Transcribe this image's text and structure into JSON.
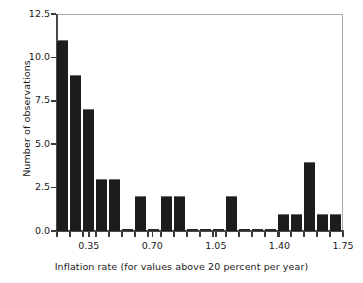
{
  "chart_data": {
    "type": "bar",
    "title": "",
    "xlabel": "Inflation rate (for values above 20 percent per year)",
    "ylabel": "Number of observations",
    "xlim": [
      0.175,
      1.75
    ],
    "ylim": [
      0.0,
      12.5
    ],
    "grid": false,
    "legend": null,
    "bin_width": 0.0715909,
    "bin_left_edges": [
      0.175,
      0.2466,
      0.3182,
      0.3898,
      0.4614,
      0.533,
      0.6045,
      0.6761,
      0.7477,
      0.8193,
      0.8909,
      0.9625,
      1.0341,
      1.1057,
      1.1773,
      1.2489,
      1.3205,
      1.392,
      1.4636,
      1.5352,
      1.6068,
      1.6784
    ],
    "values": [
      11,
      9,
      7,
      3,
      3,
      0,
      2,
      0,
      2,
      2,
      0,
      0,
      0,
      2,
      0,
      0,
      0,
      1,
      1,
      4,
      1,
      1
    ],
    "categories": [
      "0.175-0.247",
      "0.247-0.318",
      "0.318-0.390",
      "0.390-0.461",
      "0.461-0.533",
      "0.533-0.605",
      "0.605-0.676",
      "0.676-0.748",
      "0.748-0.819",
      "0.819-0.891",
      "0.891-0.963",
      "0.963-1.034",
      "1.034-1.106",
      "1.106-1.177",
      "1.177-1.249",
      "1.249-1.321",
      "1.321-1.392",
      "1.392-1.464",
      "1.464-1.535",
      "1.535-1.607",
      "1.607-1.678",
      "1.678-1.750"
    ],
    "xticks": [
      0.35,
      0.7,
      1.05,
      1.4,
      1.75
    ],
    "xticklabels": [
      "0.35",
      "0.70",
      "1.05",
      "1.40",
      "1.75"
    ],
    "yticks": [
      0.0,
      2.5,
      5.0,
      7.5,
      10.0,
      12.5
    ],
    "yticklabels": [
      "0.0",
      "2.5",
      "5.0",
      "7.5",
      "10.0",
      "12.5"
    ],
    "bar_color": "#1c1c1c",
    "axis_color": "#3a3a3a",
    "background": "#ffffff"
  }
}
